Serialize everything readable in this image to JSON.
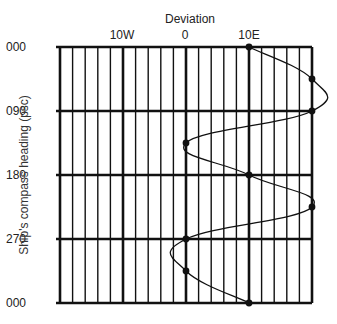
{
  "chart_data": {
    "type": "line",
    "title": "Deviation",
    "xlabel": "Deviation",
    "ylabel": "Ship's compass heading (psc)",
    "x_tick_labels": [
      "10W",
      "0",
      "10E"
    ],
    "x_tick_values": [
      -10,
      0,
      10
    ],
    "y_tick_labels": [
      "000",
      "090",
      "180",
      "270",
      "000"
    ],
    "y_tick_values": [
      0,
      90,
      180,
      270,
      360
    ],
    "xlim": [
      -20,
      20
    ],
    "ylim": [
      0,
      360
    ],
    "y_inverted": true,
    "grid": "vertical lines every 2 degrees, horizontal lines every 90 degrees",
    "series": [
      {
        "name": "Deviation curve",
        "headings": [
          0,
          45,
          90,
          135,
          180,
          225,
          270,
          315,
          360
        ],
        "deviation": [
          10,
          20,
          20,
          0,
          10,
          20,
          0,
          0,
          10
        ],
        "note": "Positive = East, negative = West"
      }
    ],
    "legend": null
  },
  "labels": {
    "title": "Deviation",
    "ylabel": "Ship's compass heading (psc)",
    "xticks": [
      "10W",
      "0",
      "10E"
    ],
    "yticks": [
      "000",
      "090",
      "180",
      "270",
      "000"
    ]
  }
}
